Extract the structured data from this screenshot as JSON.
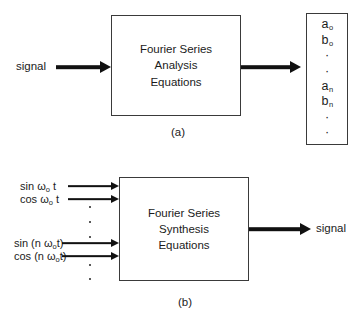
{
  "figure": {
    "background_color": "#ffffff",
    "line_color": "#3a3a3a",
    "text_color": "#1b1b1b"
  },
  "panel_a": {
    "caption": "(a)",
    "input_label": "signal",
    "box_lines": [
      "Fourier Series",
      "Analysis",
      "Equations"
    ],
    "output_vector": {
      "items": [
        "a",
        "b",
        "·",
        "·",
        "a",
        "b",
        "·",
        "·"
      ],
      "subscripts": [
        "o",
        "o",
        "",
        "",
        "n",
        "n",
        "",
        ""
      ]
    }
  },
  "panel_b": {
    "caption": "(b)",
    "box_lines": [
      "Fourier Series",
      "Synthesis",
      "Equations"
    ],
    "inputs": [
      {
        "prefix": "sin ",
        "omega": "ω",
        "sub": "o",
        "suffix": " t"
      },
      {
        "prefix": "cos ",
        "omega": "ω",
        "sub": "o",
        "suffix": " t"
      },
      {
        "prefix": "sin (n ",
        "omega": "ω",
        "sub": "o",
        "suffix": "t)"
      },
      {
        "prefix": "cos (n ",
        "omega": "ω",
        "sub": "o",
        "suffix": "t)"
      }
    ],
    "input_labels_plain": [
      "sin ωo t",
      "cos ωo t",
      "sin (nωot)",
      "cos (nωot)"
    ],
    "output_label": "signal",
    "dot_groups": [
      3,
      2
    ]
  }
}
